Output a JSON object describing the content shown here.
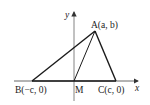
{
  "diagram": {
    "type": "coordinate-geometry",
    "axes": {
      "x_label": "x",
      "y_label": "y"
    },
    "points": {
      "A": {
        "name": "A",
        "coords": "(a, b)",
        "text": "A(a, b)"
      },
      "B": {
        "name": "B",
        "coords": "(−c, 0)",
        "text": "B(−c, 0)"
      },
      "C": {
        "name": "C",
        "coords": "(c, 0)",
        "text": "C(c, 0)"
      },
      "M": {
        "name": "M",
        "text": "M"
      }
    },
    "segments": [
      "AB",
      "AC",
      "BC",
      "AM"
    ],
    "colors": {
      "line": "#1a1a1a",
      "axis": "#555555",
      "background": "#ffffff"
    }
  }
}
